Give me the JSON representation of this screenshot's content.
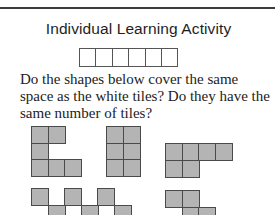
{
  "header": {
    "title": "Individual Learning Activity"
  },
  "reference_strip": {
    "tile_count": 6,
    "tile_color": "#ffffff"
  },
  "question": {
    "text": "Do the shapes below cover the same space as the white tiles? Do they have the same number of tiles?"
  },
  "shapes": [
    {
      "name": "c-shape",
      "tiles": [
        [
          0,
          0
        ],
        [
          1,
          0
        ],
        [
          0,
          1
        ],
        [
          0,
          2
        ],
        [
          1,
          2
        ],
        [
          2,
          2
        ]
      ]
    },
    {
      "name": "rectangle-2x3",
      "tiles": [
        [
          0,
          0
        ],
        [
          1,
          0
        ],
        [
          0,
          1
        ],
        [
          1,
          1
        ],
        [
          0,
          2
        ],
        [
          1,
          2
        ]
      ]
    },
    {
      "name": "l-shape-4-2",
      "tiles": [
        [
          0,
          0
        ],
        [
          1,
          0
        ],
        [
          2,
          0
        ],
        [
          3,
          0
        ],
        [
          0,
          1
        ],
        [
          1,
          1
        ]
      ]
    },
    {
      "name": "zigzag-row",
      "tiles": [
        [
          0,
          0
        ],
        [
          2,
          0
        ],
        [
          4,
          0
        ],
        [
          1,
          1
        ],
        [
          3,
          1
        ],
        [
          5,
          1
        ]
      ]
    },
    {
      "name": "s-shape",
      "tiles": [
        [
          0,
          0
        ],
        [
          1,
          0
        ],
        [
          1,
          1
        ],
        [
          2,
          1
        ]
      ]
    }
  ],
  "colors": {
    "tile_fill": "#b4b4b4",
    "tile_border": "#4a4a4a",
    "rule": "#3a3a3a"
  }
}
